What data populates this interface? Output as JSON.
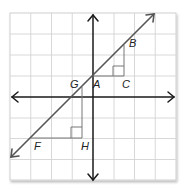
{
  "diagram": {
    "type": "coordinate-grid-with-line-and-slope-triangles",
    "grid": {
      "columns": 8,
      "rows": 8,
      "line_color": "#cfcfcf"
    },
    "axes": {
      "color": "#1a1a1a"
    },
    "line": {
      "color": "#555555",
      "slope": 1
    },
    "labels": {
      "A": "A",
      "B": "B",
      "C": "C",
      "F": "F",
      "G": "G",
      "H": "H"
    },
    "triangles": [
      {
        "name": "ABC",
        "vertices": [
          "A",
          "B",
          "C"
        ],
        "right_angle_at": "C"
      },
      {
        "name": "FGH",
        "vertices": [
          "F",
          "G",
          "H"
        ],
        "right_angle_at": "H"
      }
    ]
  }
}
